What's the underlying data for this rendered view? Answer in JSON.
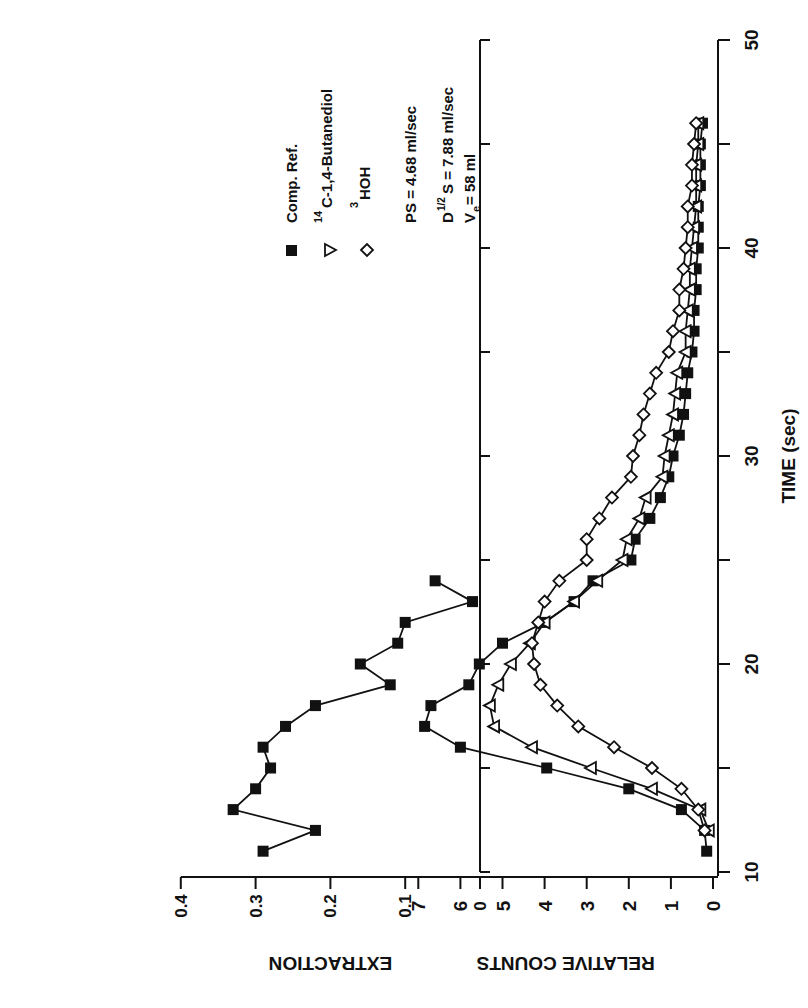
{
  "chart_data": [
    {
      "type": "line",
      "panel": "top",
      "title": "",
      "xlabel": "TIME (sec)",
      "ylabel": "EXTRACTION",
      "xlim": [
        10,
        50
      ],
      "ylim": [
        0,
        0.4
      ],
      "xticks": [
        10,
        15,
        20,
        25,
        30,
        35,
        40,
        45,
        50
      ],
      "yticks": [
        "0",
        "0.1",
        "0.2",
        "0.3",
        "0.4"
      ],
      "grid": false,
      "series": [
        {
          "name": "Extraction",
          "marker": "filled-square",
          "x": [
            11,
            12,
            13,
            14,
            15,
            16,
            17,
            18,
            19,
            20,
            21,
            22,
            23,
            24
          ],
          "values": [
            0.29,
            0.22,
            0.33,
            0.3,
            0.28,
            0.29,
            0.26,
            0.22,
            0.12,
            0.16,
            0.11,
            0.1,
            0.01,
            0.06
          ]
        }
      ]
    },
    {
      "type": "line",
      "panel": "bottom",
      "title": "",
      "xlabel": "TIME (sec)",
      "ylabel": "RELATIVE COUNTS",
      "xlim": [
        10,
        50
      ],
      "ylim": [
        0,
        7
      ],
      "xticks": [
        "10",
        "20",
        "30",
        "40",
        "50"
      ],
      "yticks": [
        "0",
        "1",
        "2",
        "3",
        "4",
        "5",
        "6",
        "7"
      ],
      "grid": false,
      "legend_position": "upper-right-inside",
      "series": [
        {
          "name": "Comp. Ref.",
          "marker": "filled-square",
          "x": [
            11,
            12,
            13,
            14,
            15,
            16,
            17,
            18,
            19,
            20,
            21,
            22,
            23,
            24,
            25,
            26,
            27,
            28,
            29,
            30,
            31,
            32,
            33,
            34,
            35,
            36,
            37,
            38,
            39,
            40,
            41,
            42,
            43,
            44,
            45,
            46
          ],
          "values": [
            0.15,
            0.2,
            0.75,
            2.0,
            3.95,
            6.0,
            6.85,
            6.7,
            5.8,
            5.55,
            5.0,
            4.0,
            3.3,
            2.85,
            1.95,
            1.85,
            1.5,
            1.25,
            1.05,
            0.95,
            0.8,
            0.7,
            0.65,
            0.6,
            0.5,
            0.45,
            0.45,
            0.4,
            0.4,
            0.35,
            0.35,
            0.35,
            0.3,
            0.3,
            0.3,
            0.25
          ]
        },
        {
          "name": "14C-1,4-Butanediol",
          "marker": "open-triangle",
          "x": [
            12,
            13,
            14,
            15,
            16,
            17,
            18,
            19,
            20,
            21,
            22,
            23,
            24,
            25,
            26,
            27,
            28,
            29,
            30,
            31,
            32,
            33,
            34,
            35,
            36,
            37,
            38,
            39,
            40,
            41,
            42,
            43,
            44,
            45,
            46
          ],
          "values": [
            0.1,
            0.3,
            1.45,
            2.9,
            4.3,
            5.2,
            5.3,
            5.1,
            4.8,
            4.35,
            4.0,
            3.3,
            2.75,
            2.15,
            2.05,
            1.75,
            1.6,
            1.2,
            1.15,
            1.05,
            0.95,
            0.9,
            0.85,
            0.65,
            0.65,
            0.6,
            0.55,
            0.55,
            0.5,
            0.45,
            0.4,
            0.4,
            0.4,
            0.35,
            0.35
          ]
        },
        {
          "name": "3HOH",
          "marker": "open-diamond",
          "x": [
            12,
            13,
            14,
            15,
            16,
            17,
            18,
            19,
            20,
            21,
            22,
            23,
            24,
            25,
            26,
            27,
            28,
            29,
            30,
            31,
            32,
            33,
            34,
            35,
            36,
            37,
            38,
            39,
            40,
            41,
            42,
            43,
            44,
            45,
            46
          ],
          "values": [
            0.2,
            0.35,
            0.75,
            1.45,
            2.35,
            3.2,
            3.7,
            4.1,
            4.25,
            4.3,
            4.15,
            4.0,
            3.65,
            3.0,
            3.0,
            2.7,
            2.4,
            1.95,
            1.9,
            1.75,
            1.65,
            1.5,
            1.35,
            1.05,
            0.95,
            0.8,
            0.8,
            0.7,
            0.65,
            0.6,
            0.6,
            0.5,
            0.5,
            0.45,
            0.4
          ]
        }
      ],
      "annotations": [
        "PS = 4.68 ml/sec",
        "D1/2S = 7.88 ml/sec",
        "Ve= 58 ml"
      ]
    }
  ],
  "figure": {
    "orientation": "rotated -90 degrees",
    "x_axis_label": "TIME (sec)",
    "x_tick_labels": [
      "10",
      "20",
      "30",
      "40",
      "50"
    ],
    "top_panel": {
      "y_label": "EXTRACTION",
      "y_tick_labels": [
        "0.4",
        "0.3",
        "0.2",
        "0.1",
        "0"
      ]
    },
    "bottom_panel": {
      "y_label": "RELATIVE COUNTS",
      "y_tick_labels": [
        "7",
        "6",
        "5",
        "4",
        "3",
        "2",
        "1",
        "0"
      ]
    },
    "legend": {
      "items": [
        {
          "label": "Comp. Ref.",
          "marker": "filled-square"
        },
        {
          "label_sup": "14",
          "label": "C-1,4-Butanediol",
          "marker": "open-triangle"
        },
        {
          "label_sup": "3",
          "label": "HOH",
          "marker": "open-diamond"
        }
      ],
      "params": {
        "ps": "PS = 4.68 ml/sec",
        "d_prefix": "D",
        "d_sup": "1/2",
        "d_rest": "S = 7.88 ml/sec",
        "ve_prefix": "V",
        "ve_sub": "e",
        "ve_rest": "= 58 ml"
      }
    },
    "colors": {
      "ink": "#111111",
      "background": "#ffffff"
    }
  }
}
